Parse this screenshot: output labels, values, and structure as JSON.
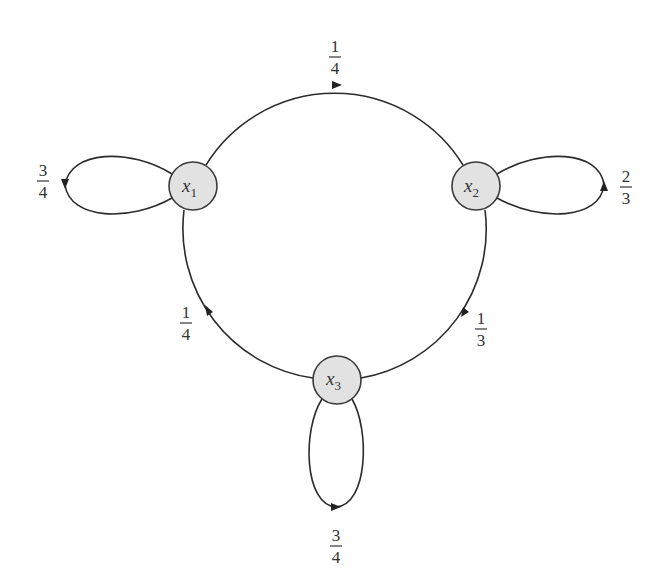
{
  "diagram": {
    "type": "markov-chain-state-diagram",
    "nodes": [
      {
        "id": "x1",
        "label": "x",
        "subscript": "1"
      },
      {
        "id": "x2",
        "label": "x",
        "subscript": "2"
      },
      {
        "id": "x3",
        "label": "x",
        "subscript": "3"
      }
    ],
    "edges": [
      {
        "from": "x1",
        "to": "x2",
        "num": "1",
        "den": "4"
      },
      {
        "from": "x2",
        "to": "x3",
        "num": "1",
        "den": "3"
      },
      {
        "from": "x3",
        "to": "x1",
        "num": "1",
        "den": "4"
      },
      {
        "from": "x1",
        "to": "x1",
        "num": "3",
        "den": "4"
      },
      {
        "from": "x2",
        "to": "x2",
        "num": "2",
        "den": "3"
      },
      {
        "from": "x3",
        "to": "x3",
        "num": "3",
        "den": "4"
      }
    ]
  }
}
